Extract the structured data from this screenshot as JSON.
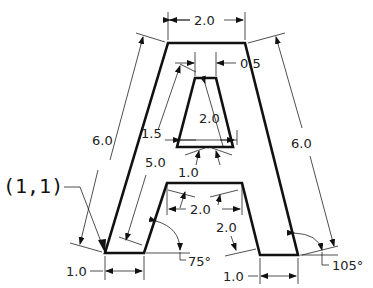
{
  "figure": {
    "origin_label": "(1,1)",
    "dimensions": {
      "top_width": "2.0",
      "apex_offset": "0.5",
      "left_outer_length": "6.0",
      "right_outer_length": "6.0",
      "inner_left_length": "5.0",
      "inner_triangle_height": "1.5",
      "inner_triangle_side": "2.0",
      "crossbar_thickness": "1.0",
      "crossbar_width": "2.0",
      "right_inner_length": "2.0",
      "left_foot_width": "1.0",
      "right_foot_width": "1.0",
      "left_angle": "75°",
      "right_angle": "105°"
    },
    "colors": {
      "outline": "#111111",
      "dimension_lines": "#222222",
      "background": "#ffffff"
    }
  }
}
